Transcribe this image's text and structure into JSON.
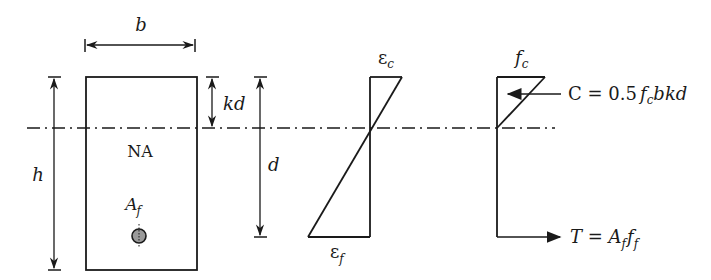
{
  "diagram": {
    "colors": {
      "stroke": "#1a1a1a",
      "bar_fill": "#9a9a9a",
      "background": "#ffffff"
    },
    "section": {
      "width_label": "b",
      "height_label": "h",
      "neutral_axis_label": "NA",
      "reinforcement_label": {
        "base": "A",
        "sub": "f"
      }
    },
    "dimensions": {
      "kd_label": "kd",
      "d_label": "d"
    },
    "strain_diagram": {
      "top_label": {
        "base": "ε",
        "sub": "c"
      },
      "bottom_label": {
        "base": "ε",
        "sub": "f"
      }
    },
    "stress_diagram": {
      "top_label": {
        "base": "f",
        "sub": "c"
      },
      "compression_force": {
        "lhs": "C",
        "eq": " = ",
        "coef": "0.5",
        "f": "f",
        "f_sub": "c",
        "rest": "bkd"
      },
      "tension_force": {
        "lhs": "T",
        "eq": " = ",
        "a": "A",
        "a_sub": "f",
        "f": "f",
        "f_sub": "f"
      }
    }
  }
}
